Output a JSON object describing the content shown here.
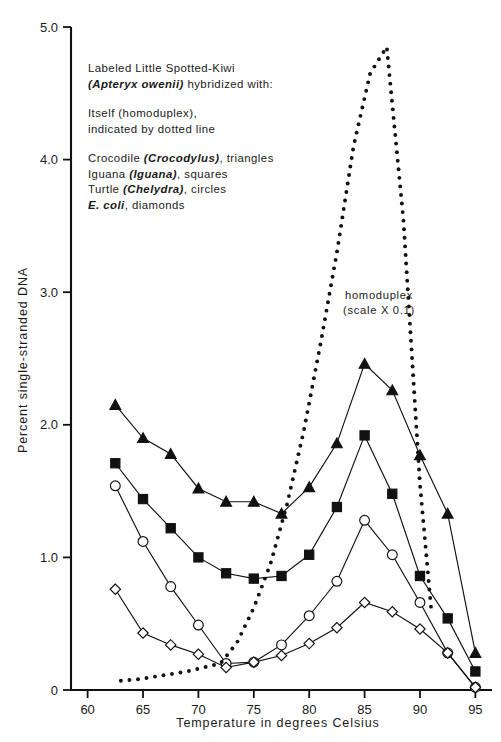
{
  "chart_data": {
    "type": "line",
    "title": "",
    "xlabel": "Temperature in degrees Celsius",
    "ylabel": "Percent single-stranded DNA",
    "xlim": [
      58.5,
      96.5
    ],
    "ylim": [
      0,
      5.0
    ],
    "xticks": [
      60,
      65,
      70,
      75,
      80,
      85,
      90,
      95
    ],
    "xticklabels": [
      "60",
      "65",
      "70",
      "75",
      "80",
      "85",
      "90",
      "95"
    ],
    "yticks": [
      0,
      1.0,
      2.0,
      3.0,
      4.0,
      5.0
    ],
    "yticklabels": [
      "0",
      "1.0",
      "2.0",
      "3.0",
      "4.0",
      "5.0"
    ],
    "grid": false,
    "legend_position": "upper-left-inside",
    "series": [
      {
        "name": "Crocodile (Crocodylus)",
        "marker": "triangle",
        "marker_style": "filled",
        "line": "solid",
        "x": [
          62.5,
          65,
          67.5,
          70,
          72.5,
          75,
          77.5,
          80,
          82.5,
          85,
          87.5,
          90,
          92.5,
          95
        ],
        "values": [
          2.15,
          1.9,
          1.78,
          1.52,
          1.42,
          1.42,
          1.33,
          1.53,
          1.86,
          2.46,
          2.26,
          1.77,
          1.33,
          0.28
        ]
      },
      {
        "name": "Iguana (Iguana)",
        "marker": "square",
        "marker_style": "filled",
        "line": "solid",
        "x": [
          62.5,
          65,
          67.5,
          70,
          72.5,
          75,
          77.5,
          80,
          82.5,
          85,
          87.5,
          90,
          92.5,
          95
        ],
        "values": [
          1.71,
          1.44,
          1.22,
          1.0,
          0.88,
          0.84,
          0.86,
          1.02,
          1.38,
          1.92,
          1.48,
          0.86,
          0.54,
          0.14
        ]
      },
      {
        "name": "Turtle (Chelydra)",
        "marker": "circle",
        "marker_style": "open",
        "line": "solid",
        "x": [
          62.5,
          65,
          67.5,
          70,
          72.5,
          75,
          77.5,
          80,
          82.5,
          85,
          87.5,
          90,
          92.5,
          95
        ],
        "values": [
          1.54,
          1.12,
          0.78,
          0.49,
          0.2,
          0.21,
          0.34,
          0.56,
          0.82,
          1.28,
          1.02,
          0.66,
          0.28,
          0.02
        ]
      },
      {
        "name": "E. coli",
        "marker": "diamond",
        "marker_style": "open",
        "line": "solid",
        "x": [
          62.5,
          65,
          67.5,
          70,
          72.5,
          75,
          77.5,
          80,
          82.5,
          85,
          87.5,
          90,
          92.5,
          95
        ],
        "values": [
          0.76,
          0.43,
          0.34,
          0.27,
          0.17,
          0.21,
          0.26,
          0.35,
          0.47,
          0.66,
          0.59,
          0.46,
          0.28,
          0.02
        ]
      },
      {
        "name": "Itself (homoduplex), scale X 0.1",
        "marker": "none",
        "marker_style": "dotted",
        "line": "dotted",
        "x": [
          63,
          64.5,
          66,
          67.5,
          69,
          70.5,
          72,
          73.5,
          75,
          76.5,
          78,
          79.5,
          81,
          82.5,
          84,
          85.5,
          87,
          88.5,
          90,
          91
        ],
        "values": [
          0.07,
          0.08,
          0.1,
          0.12,
          0.14,
          0.17,
          0.2,
          0.36,
          0.62,
          0.95,
          1.4,
          1.95,
          2.6,
          3.3,
          4.1,
          4.65,
          4.85,
          3.55,
          1.55,
          0.62
        ]
      }
    ],
    "annotations": [
      {
        "text_line1": "homoduplex",
        "text_line2": "(scale X 0.1)",
        "x": 86.3,
        "y": 2.95
      }
    ]
  },
  "legend": {
    "block1": {
      "line1": "Labeled Little Spotted-Kiwi",
      "line2_italic": "(Apteryx owenii)",
      "line2_rest": " hybridized with:"
    },
    "block2": {
      "line1": "Itself (homoduplex),",
      "line2": "indicated by dotted line"
    },
    "block3": [
      {
        "prefix": "Crocodile ",
        "italic": "(Crocodylus)",
        "suffix": ", triangles"
      },
      {
        "prefix": "Iguana ",
        "italic": "(Iguana)",
        "suffix": ", squares"
      },
      {
        "prefix": "Turtle ",
        "italic": "(Chelydra)",
        "suffix": ", circles"
      },
      {
        "prefix": "",
        "italic": "E. coli",
        "suffix": ", diamonds"
      }
    ]
  }
}
